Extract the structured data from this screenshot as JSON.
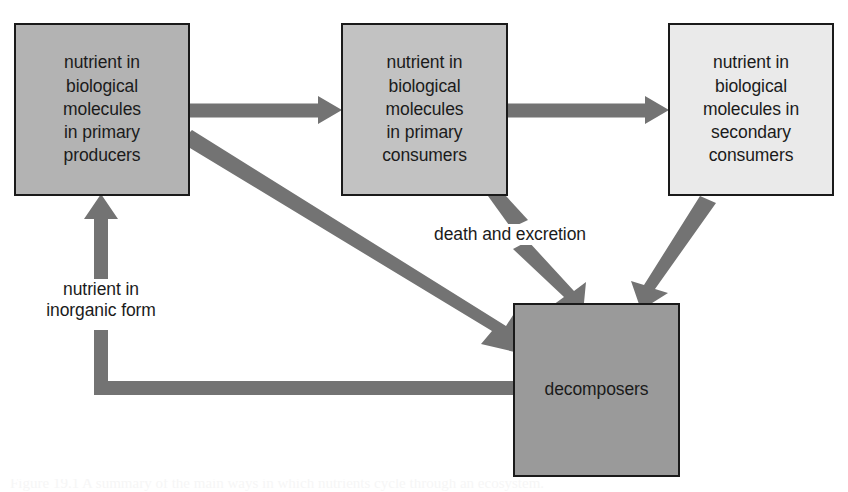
{
  "diagram": {
    "background_color": "#ffffff",
    "arrow_color": "#737373",
    "border_color": "#1a1a1a",
    "text_color": "#1b1b1b",
    "nodes": [
      {
        "id": "primary-producers",
        "label": "nutrient in\nbiological\nmolecules\nin primary\nproducers",
        "fill": "#b3b3b3",
        "x": 14,
        "y": 23,
        "w": 176,
        "h": 173
      },
      {
        "id": "primary-consumers",
        "label": "nutrient in\nbiological\nmolecules\nin primary\nconsumers",
        "fill": "#c2c2c2",
        "x": 341,
        "y": 23,
        "w": 167,
        "h": 173
      },
      {
        "id": "secondary-consumers",
        "label": "nutrient in\nbiological\nmolecules in\nsecondary\nconsumers",
        "fill": "#eaeaea",
        "x": 668,
        "y": 23,
        "w": 166,
        "h": 173
      },
      {
        "id": "decomposers",
        "label": "decomposers",
        "fill": "#9a9a9a",
        "x": 513,
        "y": 303,
        "w": 167,
        "h": 174
      }
    ],
    "edge_labels": [
      {
        "id": "death-and-excretion",
        "text": "death and excretion",
        "x": 417,
        "y": 224,
        "w": 186
      },
      {
        "id": "nutrient-in-inorganic-form",
        "text": "nutrient in\ninorganic form",
        "x": 22,
        "y": 279,
        "w": 158
      }
    ],
    "edges": [
      {
        "id": "producers-to-primary-consumers",
        "from": "primary-producers",
        "to": "primary-consumers",
        "kind": "straight-horizontal"
      },
      {
        "id": "primary-to-secondary-consumers",
        "from": "primary-consumers",
        "to": "secondary-consumers",
        "kind": "straight-horizontal"
      },
      {
        "id": "producers-to-decomposers",
        "from": "primary-producers",
        "to": "decomposers",
        "kind": "diagonal"
      },
      {
        "id": "primary-consumers-to-decomposers",
        "from": "primary-consumers",
        "to": "decomposers",
        "kind": "diagonal-broken-by-label"
      },
      {
        "id": "secondary-consumers-to-decomposers",
        "from": "secondary-consumers",
        "to": "decomposers",
        "kind": "diagonal"
      },
      {
        "id": "decomposers-to-producers",
        "from": "decomposers",
        "to": "primary-producers",
        "kind": "elbow-broken-by-label"
      }
    ]
  },
  "caption": {
    "text": "Figure 19.1 A summary of the main ways in which nutrients cycle through an ecosystem."
  }
}
